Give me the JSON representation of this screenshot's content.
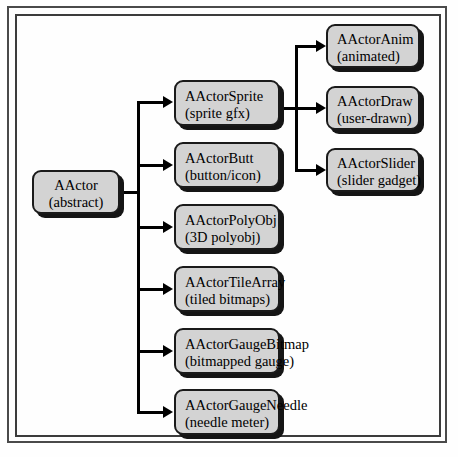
{
  "diagram": {
    "type": "class-hierarchy",
    "colors": {
      "node_fill": "#d3d3d3",
      "node_border": "#1a1a1a",
      "node_shadow": "#151515",
      "connector": "#000000",
      "frame": "#4a4a4a",
      "background": "#fefefe"
    },
    "root": {
      "name": "AActor",
      "subtitle": "(abstract)"
    },
    "children": [
      {
        "name": "AActorSprite",
        "subtitle": "(sprite gfx)"
      },
      {
        "name": "AActorButt",
        "subtitle": "(button/icon)"
      },
      {
        "name": "AActorPolyObj",
        "subtitle": "(3D polyobj)"
      },
      {
        "name": "AActorTileArray",
        "subtitle": "(tiled bitmaps)"
      },
      {
        "name": "AActorGaugeBitmap",
        "subtitle": "(bitmapped gauge)"
      },
      {
        "name": "AActorGaugeNeedle",
        "subtitle": "(needle meter)"
      }
    ],
    "sprite_children": [
      {
        "name": "AActorAnim",
        "subtitle": "(animated)"
      },
      {
        "name": "AActorDraw",
        "subtitle": "(user-drawn)"
      },
      {
        "name": "AActorSlider",
        "subtitle": "(slider gadget)"
      }
    ]
  }
}
